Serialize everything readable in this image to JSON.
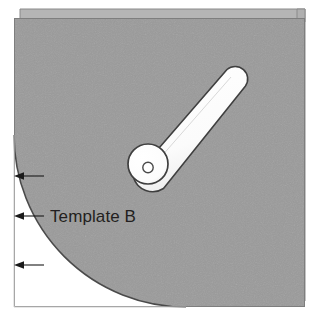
{
  "figure": {
    "title": "Template B",
    "canvas": {
      "width": 318,
      "height": 318
    }
  },
  "colors": {
    "panel_gray": "#9a9a9a",
    "back_page_gray": "#b3b3b3",
    "part_white": "#ffffff",
    "outline_dark": "#3b3b3b",
    "outline_mid": "#6f6f6f",
    "text_black": "#231f20",
    "arrow_black": "#1a1a1a",
    "page_edge": "#8a8a8a",
    "background_white": "#ffffff"
  },
  "labels": {
    "template_region": "Template B"
  },
  "annotations": {
    "arrows": [
      {
        "name": "arrow-top",
        "direction": "left",
        "x_start": 44,
        "x_end": 15,
        "y": 176
      },
      {
        "name": "arrow-middle",
        "direction": "left",
        "x_start": 44,
        "x_end": 15,
        "y": 216
      },
      {
        "name": "arrow-bottom",
        "direction": "left",
        "x_start": 44,
        "x_end": 15,
        "y": 265
      }
    ],
    "arrow_count": 3
  },
  "shapes": {
    "front_panel": {
      "x": 14,
      "y": 18,
      "width": 291,
      "height": 289
    },
    "back_page": {
      "x": 20,
      "y": 9,
      "width": 285,
      "height": 292
    },
    "template_quarter_circle": {
      "center_x": 14,
      "center_y": 307,
      "radius": 172
    },
    "knob": {
      "center_x": 148,
      "center_y": 164,
      "radius": 20
    },
    "knob_hole": {
      "center_x": 148,
      "center_y": 167,
      "radius": 5
    },
    "lever_tip": {
      "center_x": 236,
      "center_y": 81,
      "radius": 12
    }
  }
}
